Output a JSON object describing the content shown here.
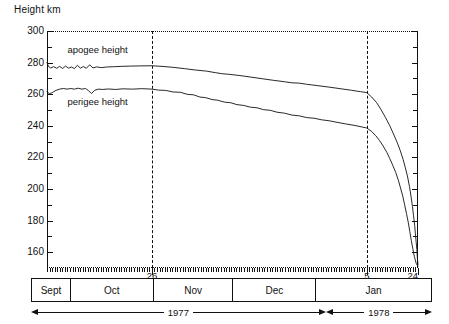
{
  "chart_data": {
    "type": "line",
    "title": "",
    "ylabel": "Height km",
    "xlabel": "",
    "ylim": [
      150,
      300
    ],
    "yticks_major": [
      300,
      280,
      260,
      240,
      220,
      200,
      180,
      160
    ],
    "ytick_minor_step": 10,
    "grid": false,
    "legend_position": "inline-annotation",
    "x_axis_kind": "calendar",
    "x_start": "1977-09-01",
    "x_end": "1978-01-24",
    "annotations": [
      {
        "name": "apogee-label",
        "text": "apogee height",
        "x_frac": 0.055,
        "y_value": 288
      },
      {
        "name": "perigee-label",
        "text": "perigee height",
        "x_frac": 0.055,
        "y_value": 255
      }
    ],
    "event_lines": [
      {
        "label": "26",
        "x_frac": 0.283,
        "style": "dashed",
        "note": "Oct 26"
      },
      {
        "label": "5",
        "x_frac": 0.862,
        "style": "dashed",
        "note": "Jan 5"
      }
    ],
    "end_marker": {
      "label": "24",
      "x_frac": 1.0,
      "note": "Jan 24 reentry"
    },
    "series": [
      {
        "name": "apogee height",
        "color": "#111111",
        "points": [
          [
            0.0,
            280.0
          ],
          [
            0.004,
            277.5
          ],
          [
            0.01,
            276.6
          ],
          [
            0.018,
            277.4
          ],
          [
            0.026,
            276.4
          ],
          [
            0.034,
            277.6
          ],
          [
            0.042,
            276.3
          ],
          [
            0.05,
            277.8
          ],
          [
            0.058,
            276.5
          ],
          [
            0.066,
            277.2
          ],
          [
            0.074,
            276.2
          ],
          [
            0.082,
            278.3
          ],
          [
            0.09,
            276.5
          ],
          [
            0.098,
            277.5
          ],
          [
            0.106,
            276.4
          ],
          [
            0.115,
            278.6
          ],
          [
            0.124,
            276.6
          ],
          [
            0.134,
            277.3
          ],
          [
            0.146,
            276.8
          ],
          [
            0.16,
            277.2
          ],
          [
            0.18,
            277.4
          ],
          [
            0.2,
            277.6
          ],
          [
            0.225,
            277.8
          ],
          [
            0.25,
            277.9
          ],
          [
            0.283,
            278.0
          ],
          [
            0.31,
            277.6
          ],
          [
            0.34,
            277.0
          ],
          [
            0.37,
            276.2
          ],
          [
            0.4,
            275.3
          ],
          [
            0.43,
            274.6
          ],
          [
            0.455,
            273.6
          ],
          [
            0.47,
            273.0
          ],
          [
            0.49,
            272.6
          ],
          [
            0.52,
            271.8
          ],
          [
            0.55,
            270.8
          ],
          [
            0.58,
            269.8
          ],
          [
            0.61,
            268.8
          ],
          [
            0.64,
            267.9
          ],
          [
            0.66,
            267.2
          ],
          [
            0.68,
            267.0
          ],
          [
            0.7,
            266.3
          ],
          [
            0.73,
            265.4
          ],
          [
            0.76,
            264.5
          ],
          [
            0.79,
            263.5
          ],
          [
            0.82,
            262.5
          ],
          [
            0.845,
            261.6
          ],
          [
            0.862,
            261.0
          ],
          [
            0.875,
            258.2
          ],
          [
            0.888,
            254.8
          ],
          [
            0.9,
            250.4
          ],
          [
            0.912,
            245.4
          ],
          [
            0.924,
            240.0
          ],
          [
            0.934,
            234.8
          ],
          [
            0.944,
            229.4
          ],
          [
            0.952,
            224.4
          ],
          [
            0.96,
            218.6
          ],
          [
            0.966,
            213.4
          ],
          [
            0.972,
            207.6
          ],
          [
            0.977,
            201.6
          ],
          [
            0.981,
            195.6
          ],
          [
            0.985,
            189.0
          ],
          [
            0.988,
            183.0
          ],
          [
            0.991,
            177.0
          ],
          [
            0.993,
            171.6
          ],
          [
            0.995,
            166.6
          ],
          [
            0.997,
            161.6
          ],
          [
            0.998,
            157.2
          ],
          [
            1.0,
            152.0
          ]
        ]
      },
      {
        "name": "perigee height",
        "color": "#111111",
        "points": [
          [
            0.0,
            261.8
          ],
          [
            0.006,
            260.2
          ],
          [
            0.014,
            261.0
          ],
          [
            0.024,
            262.4
          ],
          [
            0.034,
            263.2
          ],
          [
            0.044,
            263.6
          ],
          [
            0.054,
            263.2
          ],
          [
            0.064,
            263.6
          ],
          [
            0.074,
            263.2
          ],
          [
            0.084,
            263.8
          ],
          [
            0.094,
            263.2
          ],
          [
            0.104,
            263.6
          ],
          [
            0.112,
            262.2
          ],
          [
            0.12,
            260.4
          ],
          [
            0.128,
            262.4
          ],
          [
            0.138,
            263.2
          ],
          [
            0.15,
            263.0
          ],
          [
            0.165,
            263.3
          ],
          [
            0.185,
            263.0
          ],
          [
            0.205,
            263.4
          ],
          [
            0.23,
            263.2
          ],
          [
            0.255,
            263.5
          ],
          [
            0.283,
            263.2
          ],
          [
            0.3,
            262.6
          ],
          [
            0.32,
            262.4
          ],
          [
            0.34,
            261.4
          ],
          [
            0.36,
            261.2
          ],
          [
            0.378,
            259.9
          ],
          [
            0.395,
            259.6
          ],
          [
            0.412,
            258.2
          ],
          [
            0.428,
            257.8
          ],
          [
            0.445,
            256.6
          ],
          [
            0.46,
            256.2
          ],
          [
            0.478,
            255.0
          ],
          [
            0.495,
            254.6
          ],
          [
            0.512,
            253.4
          ],
          [
            0.53,
            252.9
          ],
          [
            0.548,
            251.8
          ],
          [
            0.566,
            251.4
          ],
          [
            0.584,
            250.2
          ],
          [
            0.602,
            249.8
          ],
          [
            0.62,
            248.6
          ],
          [
            0.64,
            248.0
          ],
          [
            0.66,
            246.8
          ],
          [
            0.68,
            246.3
          ],
          [
            0.7,
            245.2
          ],
          [
            0.72,
            244.8
          ],
          [
            0.74,
            243.8
          ],
          [
            0.76,
            243.2
          ],
          [
            0.782,
            242.2
          ],
          [
            0.805,
            241.2
          ],
          [
            0.83,
            240.2
          ],
          [
            0.85,
            239.2
          ],
          [
            0.862,
            238.6
          ],
          [
            0.874,
            236.6
          ],
          [
            0.886,
            233.8
          ],
          [
            0.896,
            230.8
          ],
          [
            0.906,
            227.2
          ],
          [
            0.916,
            223.2
          ],
          [
            0.924,
            219.2
          ],
          [
            0.932,
            215.0
          ],
          [
            0.94,
            210.4
          ],
          [
            0.947,
            205.6
          ],
          [
            0.953,
            200.6
          ],
          [
            0.959,
            195.4
          ],
          [
            0.964,
            190.0
          ],
          [
            0.969,
            184.4
          ],
          [
            0.974,
            178.6
          ],
          [
            0.978,
            173.0
          ],
          [
            0.982,
            167.4
          ],
          [
            0.986,
            162.2
          ],
          [
            0.99,
            157.4
          ],
          [
            0.995,
            153.0
          ],
          [
            1.0,
            151.0
          ]
        ]
      }
    ],
    "months": [
      {
        "label": "Sept",
        "width_frac": 0.0975
      },
      {
        "label": "Oct",
        "width_frac": 0.2075
      },
      {
        "label": "Nov",
        "width_frac": 0.2
      },
      {
        "label": "Dec",
        "width_frac": 0.2075
      },
      {
        "label": "Jan",
        "width_frac": 0.2875
      }
    ],
    "years": [
      {
        "label": "1977",
        "width_frac": 0.735
      },
      {
        "label": "1978",
        "width_frac": 0.265
      }
    ]
  }
}
